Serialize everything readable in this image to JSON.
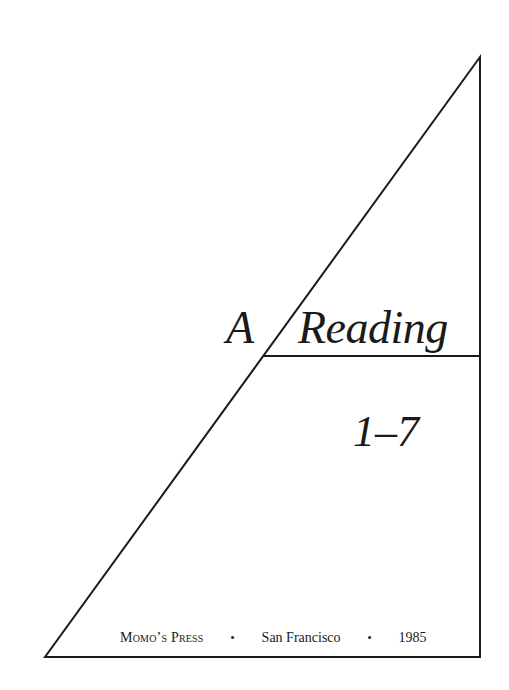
{
  "title_page": {
    "title_word_1": "A",
    "title_word_2": "Reading",
    "subtitle_numbers": "1–7",
    "imprint": {
      "publisher": "Momo’s Press",
      "separator": "•",
      "city": "San Francisco",
      "year": "1985"
    }
  },
  "colors": {
    "ink": "#1a1a1a",
    "paper": "#ffffff"
  }
}
